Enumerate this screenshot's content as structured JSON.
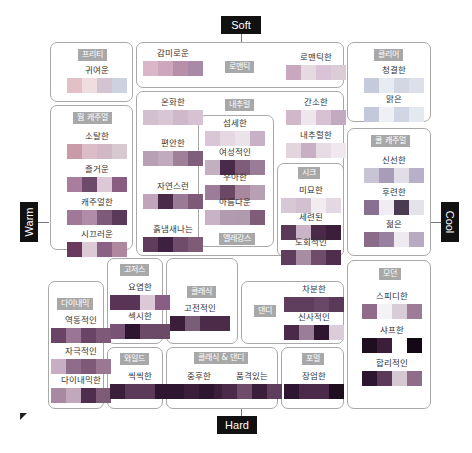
{
  "axes": {
    "top": "Soft",
    "bottom": "Hard",
    "left": "Warm",
    "right": "Cool"
  },
  "groups": [
    {
      "id": "pretty",
      "label": "프리티",
      "x": 50,
      "y": 42,
      "w": 83,
      "h": 60,
      "tx": 78,
      "ty": 49,
      "items": [
        {
          "label": "귀여운",
          "x": 67,
          "y": 64,
          "colors": [
            "#e2c0c8",
            "#f0dde0",
            "#d4c4d2",
            "#cdd2e0"
          ]
        }
      ]
    },
    {
      "id": "romantic",
      "label": "로맨틱",
      "x": 136,
      "y": 42,
      "w": 208,
      "h": 46,
      "tx": 225,
      "ty": 61,
      "items": [
        {
          "label": "감미로운",
          "x": 143,
          "y": 47,
          "colors": [
            "#d9b6c8",
            "#cfa7bd",
            "#b78fa9",
            "#a98aa6"
          ]
        },
        {
          "label": "로맨틱한",
          "x": 286,
          "y": 51,
          "colors": [
            "#c7a8bf",
            "#e6dae2",
            "#d8c4d6",
            "#dcccd8"
          ]
        }
      ]
    },
    {
      "id": "clear",
      "label": "클리어",
      "x": 347,
      "y": 42,
      "w": 84,
      "h": 80,
      "tx": 374,
      "ty": 49,
      "items": [
        {
          "label": "청결한",
          "x": 364,
          "y": 64,
          "colors": [
            "#c6cbdb",
            "#e8ebf2",
            "#d3d7e4",
            "#dde0ea"
          ]
        },
        {
          "label": "맑은",
          "x": 364,
          "y": 93,
          "colors": [
            "#c4c8db",
            "#eef0f5",
            "#d0d6e4",
            "#e4e8ef"
          ]
        }
      ]
    },
    {
      "id": "warm-casual",
      "label": "웜 캐주얼",
      "x": 50,
      "y": 105,
      "w": 83,
      "h": 145,
      "tx": 73,
      "ty": 112,
      "items": [
        {
          "label": "소탈한",
          "x": 67,
          "y": 130,
          "colors": [
            "#c99aa8",
            "#dcbcc6",
            "#d2b8c4",
            "#d8c8d0"
          ]
        },
        {
          "label": "즐거운",
          "x": 67,
          "y": 163,
          "colors": [
            "#a87e9c",
            "#6e4a6a",
            "#dcc8d6",
            "#8a5e80"
          ]
        },
        {
          "label": "캐주얼한",
          "x": 67,
          "y": 196,
          "colors": [
            "#a07898",
            "#b08ca8",
            "#7e5a7a",
            "#5a3a58"
          ]
        },
        {
          "label": "시끄러운",
          "x": 67,
          "y": 228,
          "colors": [
            "#6a3a5e",
            "#dccad6",
            "#8a6286",
            "#b0889e"
          ]
        }
      ]
    },
    {
      "id": "natural",
      "label": "내추럴",
      "x": 136,
      "y": 91,
      "w": 208,
      "h": 165,
      "tx": 225,
      "ty": 99,
      "items": [
        {
          "label": "온화한",
          "x": 143,
          "y": 96,
          "colors": [
            "#d2c0d0",
            "#d8c6d4",
            "#ceb8ca",
            "#d6c2d2"
          ]
        },
        {
          "label": "편안한",
          "x": 143,
          "y": 137,
          "colors": [
            "#b8a0b4",
            "#c2aabe",
            "#9e8098",
            "#7e5e7a"
          ]
        },
        {
          "label": "자연스런",
          "x": 143,
          "y": 180,
          "colors": [
            "#c2a4bc",
            "#4a2a48",
            "#9a7a94",
            "#7e5a78"
          ]
        },
        {
          "label": "흙냄새나는",
          "x": 143,
          "y": 223,
          "colors": [
            "#5e3c5a",
            "#3e2040",
            "#6e4c6a",
            "#7e5c78"
          ]
        },
        {
          "label": "간소한",
          "x": 286,
          "y": 96,
          "colors": [
            "#d0b8c8",
            "#eee6ec",
            "#d6c2d2",
            "#c4aac0"
          ]
        },
        {
          "label": "내추럴한",
          "x": 286,
          "y": 129,
          "colors": [
            "#e4d4de",
            "#c8b0c4",
            "#e8dce4",
            "#f0e8ee"
          ]
        }
      ]
    },
    {
      "id": "elegance",
      "label": "엘레강스",
      "x": 198,
      "y": 115,
      "w": 76,
      "h": 132,
      "tx": 219,
      "ty": 233,
      "inner": true,
      "items": [
        {
          "label": "섬세한",
          "x": 205,
          "y": 117,
          "colors": [
            "#d8c6d6",
            "#e6d8e2",
            "#ece2ea",
            "#c8b0c6"
          ]
        },
        {
          "label": "여성적인",
          "x": 205,
          "y": 146,
          "colors": [
            "#c4aec2",
            "#4a2a4a",
            "#7e5c7a",
            "#9a7c96"
          ]
        },
        {
          "label": "우아한",
          "x": 205,
          "y": 171,
          "colors": [
            "#9c7c98",
            "#6a4866",
            "#a8889e",
            "#b8a0b4"
          ]
        },
        {
          "label": "아름다운",
          "x": 205,
          "y": 196,
          "colors": [
            "#c8b2c6",
            "#b29ab0",
            "#b09aae",
            "#7e5c7a"
          ]
        }
      ]
    },
    {
      "id": "chic",
      "label": "시크",
      "x": 277,
      "y": 163,
      "w": 67,
      "h": 94,
      "tx": 298,
      "ty": 167,
      "items": [
        {
          "label": "미묘한",
          "x": 281,
          "y": 184,
          "colors": [
            "#d8c8d6",
            "#d2c0d0",
            "#f2ecf0",
            "#e4d8e2"
          ]
        },
        {
          "label": "세련된",
          "x": 281,
          "y": 211,
          "colors": [
            "#5a3a58",
            "#c8b4c6",
            "#4a2a48",
            "#3a1e3a"
          ]
        },
        {
          "label": "도회적인",
          "x": 281,
          "y": 236,
          "colors": [
            "#5e3e5c",
            "#a88ca4",
            "#6e4c6a",
            "#4e2e4c"
          ]
        }
      ]
    },
    {
      "id": "cool-casual",
      "label": "쿨 캐주얼",
      "x": 347,
      "y": 128,
      "w": 84,
      "h": 128,
      "tx": 371,
      "ty": 135,
      "items": [
        {
          "label": "신선한",
          "x": 364,
          "y": 154,
          "colors": [
            "#c8c4d6",
            "#a89cb8",
            "#e2dee8",
            "#b8b0c8"
          ]
        },
        {
          "label": "후련한",
          "x": 364,
          "y": 186,
          "colors": [
            "#8a7090",
            "#f0ecf2",
            "#4a3a52",
            "#e4e2ea"
          ]
        },
        {
          "label": "젊은",
          "x": 364,
          "y": 218,
          "colors": [
            "#8a6c8a",
            "#9a80a0",
            "#eeeaf0",
            "#b8aac0"
          ]
        }
      ]
    },
    {
      "id": "gorgeous",
      "label": "고저스",
      "x": 107,
      "y": 258,
      "w": 56,
      "h": 86,
      "tx": 120,
      "ty": 264,
      "items": [
        {
          "label": "요염한",
          "x": 110,
          "y": 281,
          "colors": [
            "#5a3456",
            "#5a3456",
            "#dcc8d6",
            "#8a5e84"
          ]
        },
        {
          "label": "섹시한",
          "x": 110,
          "y": 310,
          "colors": [
            "#7a5276",
            "#2e1630",
            "#6a4a66",
            "#6a4a66"
          ]
        }
      ]
    },
    {
      "id": "classic",
      "label": "클래식",
      "x": 166,
      "y": 258,
      "w": 72,
      "h": 86,
      "tx": 187,
      "ty": 286,
      "items": [
        {
          "label": "고전적인",
          "x": 170,
          "y": 302,
          "colors": [
            "#3a1e3a",
            "#7a5e78",
            "#4a2c48",
            "#4a2c48"
          ]
        }
      ]
    },
    {
      "id": "dandy",
      "label": "댄디",
      "x": 241,
      "y": 281,
      "w": 103,
      "h": 63,
      "tx": 254,
      "ty": 305,
      "items": [
        {
          "label": "차분한",
          "x": 284,
          "y": 283,
          "colors": [
            "#5e3e5c",
            "#5e3e5c",
            "#684866",
            "#5a3a58"
          ]
        },
        {
          "label": "신사적인",
          "x": 284,
          "y": 311,
          "colors": [
            "#4a2a48",
            "#9a7e98",
            "#2e1630",
            "#dcccd8"
          ]
        }
      ]
    },
    {
      "id": "dynamic",
      "label": "다이내믹",
      "x": 48,
      "y": 281,
      "w": 56,
      "h": 128,
      "tx": 57,
      "ty": 298,
      "items": [
        {
          "label": "역동적인",
          "x": 51,
          "y": 314,
          "colors": [
            "#6a4466",
            "#9a7694",
            "#6a4466",
            "#7e5a78"
          ]
        },
        {
          "label": "자극적인",
          "x": 51,
          "y": 345,
          "colors": [
            "#c8aec2",
            "#8e6c8a",
            "#7e5a78",
            "#9a7894"
          ]
        },
        {
          "label": "다이내믹한",
          "x": 51,
          "y": 374,
          "colors": [
            "#a888a2",
            "#c2a8bc",
            "#4e2e4c",
            "#7e5c78"
          ]
        }
      ]
    },
    {
      "id": "wild",
      "label": "와일드",
      "x": 107,
      "y": 347,
      "w": 56,
      "h": 62,
      "tx": 120,
      "ty": 353,
      "items": [
        {
          "label": "씩씩한",
          "x": 110,
          "y": 370,
          "colors": [
            "#3a1e3a",
            "#5a3a58",
            "#5a3a58",
            "#2e1630"
          ]
        }
      ]
    },
    {
      "id": "classic-dandy",
      "label": "클래식 & 댄디",
      "x": 166,
      "y": 347,
      "w": 112,
      "h": 62,
      "tx": 194,
      "ty": 352,
      "items": [
        {
          "label": "중후한",
          "x": 169,
          "y": 370,
          "colors": [
            "#2e1630",
            "#3a1e3a",
            "#2e1630",
            "#3a1e3a"
          ]
        },
        {
          "label": "품격있는",
          "x": 222,
          "y": 370,
          "colors": [
            "#4a2a48",
            "#6e4c6a",
            "#3a1e3a",
            "#5e3e5c"
          ]
        }
      ]
    },
    {
      "id": "formal",
      "label": "포멀",
      "x": 281,
      "y": 347,
      "w": 63,
      "h": 62,
      "tx": 302,
      "ty": 353,
      "items": [
        {
          "label": "장엄한",
          "x": 284,
          "y": 370,
          "colors": [
            "#2e1630",
            "#4a2a48",
            "#4a2a48",
            "#1e0e20"
          ]
        }
      ]
    },
    {
      "id": "modern",
      "label": "모던",
      "x": 347,
      "y": 260,
      "w": 84,
      "h": 149,
      "tx": 379,
      "ty": 268,
      "items": [
        {
          "label": "스피디한",
          "x": 362,
          "y": 290,
          "colors": [
            "#8e6c8a",
            "#f4f2f4",
            "#d8ccd6",
            "#9c7c98"
          ]
        },
        {
          "label": "샤프한",
          "x": 362,
          "y": 324,
          "colors": [
            "#1e0e20",
            "#3a1e3a",
            "#ffffff",
            "#140814"
          ]
        },
        {
          "label": "합리적인",
          "x": 362,
          "y": 357,
          "colors": [
            "#2e1630",
            "#5a3a58",
            "#d6c8d2",
            "#8e6c8a"
          ]
        }
      ]
    }
  ]
}
